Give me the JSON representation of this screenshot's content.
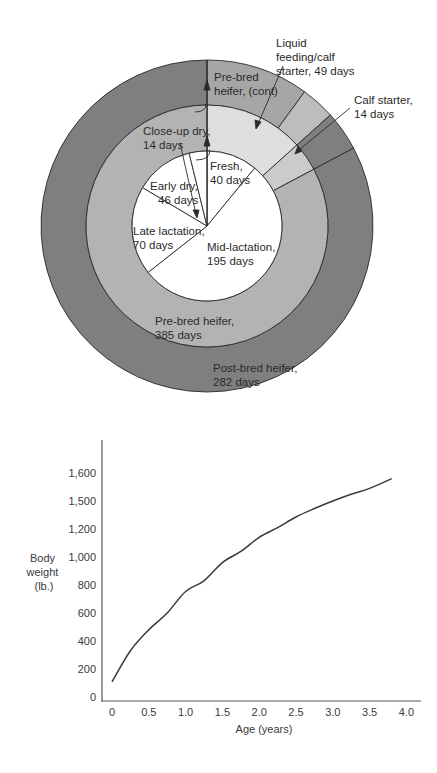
{
  "donut": {
    "colors": {
      "outer_dark": "#7f7f7f",
      "outer_medium": "#a6a6a6",
      "outer_light": "#bdbdbd",
      "middle_medium": "#b3b3b3",
      "middle_light": "#dedede",
      "middle_lighter": "#cbcbcb",
      "inner": "#ffffff",
      "stroke": "#2a2a2a"
    },
    "inner_segments": [
      {
        "label": "Fresh,",
        "days": "40 days",
        "value": 40
      },
      {
        "label": "Mid-lactation,",
        "days": "195 days",
        "value": 195
      },
      {
        "label": "Late lactation,",
        "days": "70 days",
        "value": 70
      },
      {
        "label": "Early dry,",
        "days": "46 days",
        "value": 46
      },
      {
        "label": "Close-up dry,",
        "days": "14 days",
        "value": 14
      }
    ],
    "middle_segments": [
      {
        "label": "Liquid feeding/calf starter, 49 days",
        "value": 49
      },
      {
        "label": "Calf starter, 14 days",
        "value": 14
      },
      {
        "label": "Pre-bred heifer, 385 days",
        "value": 302
      }
    ],
    "outer_segments": [
      {
        "label": "Pre-bred heifer, (cont)",
        "value": 36
      },
      {
        "label": "Liquid feeding band",
        "value": 12
      },
      {
        "label": "Calf starter band",
        "value": 14
      },
      {
        "label": "Post-bred heifer, 282 days",
        "value": 303
      }
    ],
    "labels": {
      "liquid_1": "Liquid",
      "liquid_2": "feeding/calf",
      "liquid_3": "starter, 49 days",
      "calf_1": "Calf starter,",
      "calf_2": "14 days",
      "prebred_cont_1": "Pre-bred",
      "prebred_cont_2": "heifer, (cont)",
      "closeup_1": "Close-up dry,",
      "closeup_2": "14 days",
      "fresh_1": "Fresh,",
      "fresh_2": "40 days",
      "earlydry_1": "Early dry,",
      "earlydry_2": "46 days",
      "late_1": "Late lactation,",
      "late_2": "70 days",
      "mid_1": "Mid-lactation,",
      "mid_2": "195 days",
      "prebred_1": "Pre-bred heifer,",
      "prebred_2": "385 days",
      "postbred_1": "Post-bred heifer,",
      "postbred_2": "282 days"
    }
  },
  "chart_data": [
    {
      "type": "pie",
      "title": "Dairy cow life cycle (days)",
      "rings": [
        {
          "name": "Cow lactation cycle (inner)",
          "categories": [
            "Fresh",
            "Mid-lactation",
            "Late lactation",
            "Early dry",
            "Close-up dry"
          ],
          "values": [
            40,
            195,
            70,
            46,
            14
          ]
        },
        {
          "name": "Heifer rearing (middle)",
          "categories": [
            "Liquid feeding/calf starter",
            "Calf starter",
            "Pre-bred heifer"
          ],
          "values": [
            49,
            14,
            385
          ]
        },
        {
          "name": "Heifer rearing (outer)",
          "categories": [
            "Pre-bred heifer (cont)",
            "Post-bred heifer"
          ],
          "values": [
            0,
            282
          ]
        }
      ]
    },
    {
      "type": "line",
      "title": "",
      "xlabel": "Age (years)",
      "ylabel": "Body weight (lb.)",
      "x_ticks": [
        "0",
        "0.5",
        "1.0",
        "1.5",
        "2.0",
        "2.5",
        "3.0",
        "3.5",
        "4.0"
      ],
      "y_ticks": [
        "0",
        "200",
        "400",
        "600",
        "800",
        "1,000",
        "1,200",
        "1,500",
        "1,600"
      ],
      "xlim": [
        0,
        4.0
      ],
      "ylim": [
        0,
        1600
      ],
      "grid": false,
      "series": [
        {
          "name": "Body weight",
          "x": [
            0,
            0.25,
            0.5,
            0.75,
            1.0,
            1.25,
            1.5,
            1.75,
            2.0,
            2.25,
            2.5,
            2.75,
            3.0,
            3.25,
            3.5,
            3.8
          ],
          "y_tick_position": [
            0.54,
            1.65,
            2.4,
            3.0,
            3.77,
            4.15,
            4.8,
            5.2,
            5.7,
            6.05,
            6.43,
            6.73,
            7.0,
            7.24,
            7.45,
            7.8
          ],
          "values": [
            108,
            330,
            480,
            600,
            754,
            830,
            960,
            1040,
            1140,
            1210,
            1300,
            1390,
            1500,
            1525,
            1545,
            1580
          ]
        }
      ]
    }
  ]
}
